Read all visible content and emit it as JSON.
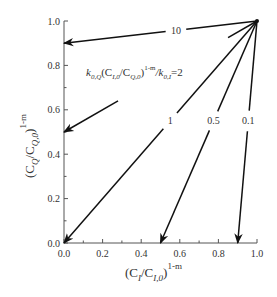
{
  "chart_data": {
    "type": "line",
    "title": "",
    "xlabel": "(C_I/C_I,0)^(1-m)",
    "ylabel": "(C_Q/C_Q,0)^(1-m)",
    "xlabel_parts": {
      "base": "(C",
      "sub1": "I",
      "mid": "/C",
      "sub2": "I,0",
      "close": ")",
      "sup": "1-m"
    },
    "ylabel_parts": {
      "base": "(C",
      "sub1": "Q",
      "mid": "/C",
      "sub2": "Q,0",
      "close": ")",
      "sup": "1-m"
    },
    "xlim": [
      0.0,
      1.0
    ],
    "ylim": [
      0.0,
      1.0
    ],
    "x_ticks": [
      "0.0",
      "0.2",
      "0.4",
      "0.6",
      "0.8",
      "1.0"
    ],
    "y_ticks": [
      "0.0",
      "0.2",
      "0.4",
      "0.6",
      "0.8",
      "1.0"
    ],
    "grid": false,
    "annotation": {
      "text": "k_0,Q(C_I,0/C_Q,0)^(1-m)/k_0,I=2",
      "parts": {
        "k": "k",
        "sub_k": "0,Q",
        "open": "(C",
        "sub_a": "I,0",
        "mid": "/C",
        "sub_b": "Q,0",
        "close": ")",
        "sup": "1-m",
        "slash": "/k",
        "sub_c": "0,I",
        "eq": "=2"
      }
    },
    "series": [
      {
        "name": "10",
        "x": [
          1.0,
          0.0
        ],
        "y": [
          1.0,
          0.9
        ]
      },
      {
        "name": "2",
        "x": [
          1.0,
          0.0
        ],
        "y": [
          1.0,
          0.5
        ]
      },
      {
        "name": "1",
        "x": [
          1.0,
          0.0
        ],
        "y": [
          1.0,
          0.0
        ]
      },
      {
        "name": "0.5",
        "x": [
          1.0,
          0.5
        ],
        "y": [
          1.0,
          0.0
        ]
      },
      {
        "name": "0.1",
        "x": [
          1.0,
          0.9
        ],
        "y": [
          1.0,
          0.0
        ]
      }
    ],
    "series_label_positions": [
      {
        "name": "10",
        "t": 0.42
      },
      {
        "name": "1",
        "t": 0.45
      },
      {
        "name": "0.5",
        "t": 0.45
      },
      {
        "name": "0.1",
        "t": 0.45
      }
    ]
  }
}
